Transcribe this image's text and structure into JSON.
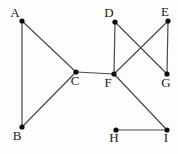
{
  "diagram": {
    "type": "undirected-graph",
    "background_color": "#fdfdfd",
    "edge_color": "#4a4a4a",
    "edge_width": 1.2,
    "node_color": "#0d0d0d",
    "node_radius": 2.6,
    "label_color": "#1a1a1a",
    "nodes": [
      {
        "id": "A",
        "label": "A",
        "x": 22,
        "y": 21,
        "label_dx": -7,
        "label_dy": -4
      },
      {
        "id": "B",
        "label": "B",
        "x": 22,
        "y": 127,
        "label_dx": -5,
        "label_dy": 13
      },
      {
        "id": "C",
        "label": "C",
        "x": 76,
        "y": 72,
        "label_dx": -1,
        "label_dy": 13
      },
      {
        "id": "D",
        "label": "D",
        "x": 115,
        "y": 22,
        "label_dx": -6,
        "label_dy": -5
      },
      {
        "id": "E",
        "label": "E",
        "x": 168,
        "y": 21,
        "label_dx": -3,
        "label_dy": -5
      },
      {
        "id": "F",
        "label": "F",
        "x": 114,
        "y": 74,
        "label_dx": -6,
        "label_dy": 13
      },
      {
        "id": "G",
        "label": "G",
        "x": 167,
        "y": 74,
        "label_dx": -1,
        "label_dy": 13
      },
      {
        "id": "H",
        "label": "H",
        "x": 116,
        "y": 130,
        "label_dx": -2,
        "label_dy": 12
      },
      {
        "id": "I",
        "label": "I",
        "x": 167,
        "y": 130,
        "label_dx": -1,
        "label_dy": 12
      }
    ],
    "edges": [
      [
        "A",
        "B"
      ],
      [
        "A",
        "C"
      ],
      [
        "B",
        "C"
      ],
      [
        "C",
        "F"
      ],
      [
        "D",
        "F"
      ],
      [
        "D",
        "G"
      ],
      [
        "E",
        "F"
      ],
      [
        "E",
        "G"
      ],
      [
        "F",
        "I"
      ],
      [
        "H",
        "I"
      ]
    ]
  }
}
